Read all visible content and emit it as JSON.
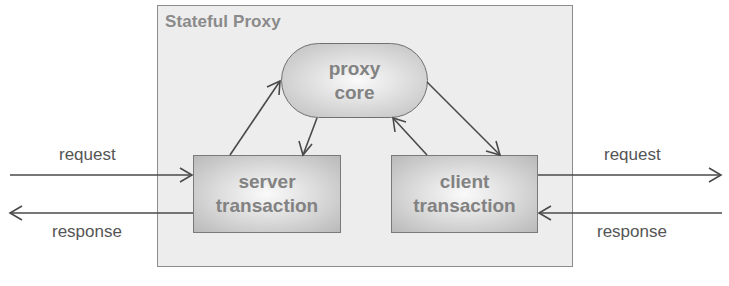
{
  "diagram": {
    "container": {
      "title": "Stateful Proxy"
    },
    "nodes": {
      "proxy_core": {
        "line1": "proxy",
        "line2": "core"
      },
      "server_transaction": {
        "line1": "server",
        "line2": "transaction"
      },
      "client_transaction": {
        "line1": "client",
        "line2": "transaction"
      }
    },
    "external_labels": {
      "left_request": "request",
      "left_response": "response",
      "right_request": "request",
      "right_response": "response"
    },
    "edges": [
      {
        "from": "external-left",
        "to": "server_transaction",
        "label": "request"
      },
      {
        "from": "server_transaction",
        "to": "external-left",
        "label": "response"
      },
      {
        "from": "server_transaction",
        "to": "proxy_core"
      },
      {
        "from": "proxy_core",
        "to": "server_transaction"
      },
      {
        "from": "client_transaction",
        "to": "proxy_core"
      },
      {
        "from": "proxy_core",
        "to": "client_transaction"
      },
      {
        "from": "client_transaction",
        "to": "external-right",
        "label": "request"
      },
      {
        "from": "external-right",
        "to": "client_transaction",
        "label": "response"
      }
    ],
    "colors": {
      "container_fill": "#ededed",
      "container_border": "#8c8c8c",
      "node_text": "#828282",
      "arrow": "#4a4a4a",
      "label_text": "#555555"
    }
  }
}
